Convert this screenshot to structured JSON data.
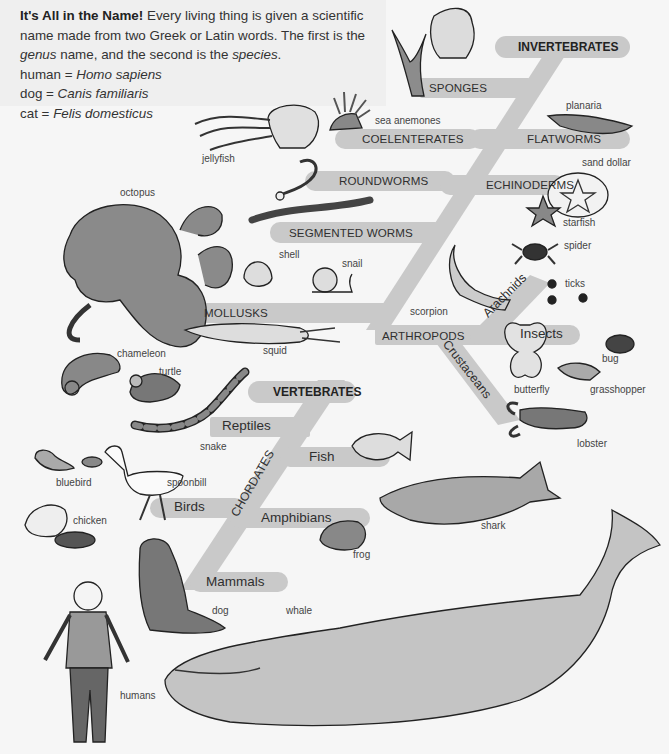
{
  "intro": {
    "title": "It's All in the Name!",
    "text_1": " Every living thing is given a scientific name made from two Greek or Latin words.  The first is the ",
    "genus": "genus",
    "text_2": " name, and the second is the ",
    "species": "species",
    "text_3": ".",
    "examples": [
      {
        "common": "human = ",
        "scientific": "Homo sapiens"
      },
      {
        "common": "dog = ",
        "scientific": "Canis familiaris"
      },
      {
        "common": "cat = ",
        "scientific": "Felis domesticus"
      }
    ]
  },
  "colors": {
    "branch": "#c9c9c9",
    "intro_bg": "#efefef",
    "background": "#f6f6f6",
    "animal_fill": "#8c8c8c",
    "animal_light": "#d4d4d4",
    "outline": "#222222"
  },
  "groups": {
    "invertebrates": "INVERTEBRATES",
    "vertebrates": "VERTEBRATES",
    "chordates": "CHORDATES"
  },
  "branches": {
    "sponges": "SPONGES",
    "coelenterates": "COELENTERATES",
    "flatworms": "FLATWORMS",
    "roundworms": "ROUNDWORMS",
    "echinoderms": "ECHINODERMS",
    "segmented_worms": "SEGMENTED WORMS",
    "mollusks": "MOLLUSKS",
    "arthropods": "ARTHROPODS",
    "arachnids": "Arachnids",
    "insects": "Insects",
    "crustaceans": "Crustaceans",
    "reptiles": "Reptiles",
    "fish": "Fish",
    "birds": "Birds",
    "amphibians": "Amphibians",
    "mammals": "Mammals"
  },
  "animals": {
    "sea_anemones": "sea anemones",
    "planaria": "planaria",
    "jellyfish": "jellyfish",
    "sand_dollar": "sand dollar",
    "octopus": "octopus",
    "starfish": "starfish",
    "spider": "spider",
    "shell": "shell",
    "snail": "snail",
    "ticks": "ticks",
    "scorpion": "scorpion",
    "squid": "squid",
    "bug": "bug",
    "chameleon": "chameleon",
    "turtle": "turtle",
    "butterfly": "butterfly",
    "grasshopper": "grasshopper",
    "snake": "snake",
    "lobster": "lobster",
    "bluebird": "bluebird",
    "spoonbill": "spoonbill",
    "chicken": "chicken",
    "shark": "shark",
    "frog": "frog",
    "dog": "dog",
    "whale": "whale",
    "humans": "humans"
  }
}
